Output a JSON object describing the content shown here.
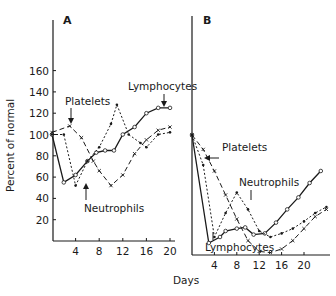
{
  "chart_data": [
    {
      "panel": "A",
      "type": "line",
      "title": "A",
      "xlabel": "Days",
      "ylabel": "Percent of normal",
      "xlim": [
        0,
        21
      ],
      "ylim": [
        0,
        175
      ],
      "xticks": [
        4,
        8,
        12,
        16,
        20
      ],
      "yticks": [
        20,
        40,
        60,
        80,
        100,
        120,
        140,
        160
      ],
      "grid": false,
      "legend": "inline annotations",
      "series": [
        {
          "name": "Lymphocytes",
          "style": "solid",
          "marker": "open-circle",
          "x": [
            0,
            2,
            4,
            6,
            7.5,
            9,
            10.5,
            12,
            14,
            16,
            18,
            20
          ],
          "y": [
            100,
            55,
            62,
            75,
            83,
            85,
            85,
            100,
            107,
            120,
            125,
            125
          ]
        },
        {
          "name": "Platelets",
          "style": "dashed",
          "marker": "x",
          "x": [
            0,
            3,
            5,
            7,
            8,
            10,
            12,
            14,
            16,
            18,
            20
          ],
          "y": [
            102,
            108,
            97,
            75,
            66,
            52,
            62,
            82,
            95,
            104,
            107
          ]
        },
        {
          "name": "Neutrophils",
          "style": "dotted",
          "marker": "dot",
          "x": [
            0,
            2,
            4,
            6,
            8,
            10,
            11,
            13,
            15,
            16,
            18,
            20
          ],
          "y": [
            100,
            100,
            52,
            75,
            88,
            110,
            128,
            100,
            92,
            88,
            100,
            102
          ]
        }
      ],
      "annotations": [
        "Platelets",
        "Lymphocytes",
        "Neutrophils"
      ]
    },
    {
      "panel": "B",
      "type": "line",
      "title": "B",
      "xlabel": "Days",
      "ylabel": "Percent of normal",
      "xlim": [
        0,
        24
      ],
      "ylim": [
        0,
        110
      ],
      "xticks": [
        4,
        8,
        12,
        16,
        20
      ],
      "grid": false,
      "legend": "inline annotations",
      "series": [
        {
          "name": "Lymphocytes",
          "style": "solid",
          "marker": "open-circle",
          "x": [
            0,
            3,
            5,
            6,
            8,
            9.5,
            11,
            13,
            15,
            17,
            19,
            21,
            23
          ],
          "y": [
            100,
            10,
            15,
            20,
            22,
            23,
            17,
            18,
            27,
            38,
            48,
            60,
            70
          ]
        },
        {
          "name": "Platelets",
          "style": "dashed",
          "marker": "x",
          "x": [
            0,
            2,
            4,
            6,
            8,
            10,
            12,
            14,
            16,
            18,
            20,
            22,
            24
          ],
          "y": [
            100,
            88,
            70,
            50,
            30,
            12,
            3,
            2,
            5,
            12,
            22,
            32,
            38
          ]
        },
        {
          "name": "Neutrophils",
          "style": "dotted",
          "marker": "dot",
          "x": [
            0,
            2,
            4,
            6,
            8,
            10,
            12,
            14,
            16,
            18,
            20,
            22,
            24
          ],
          "y": [
            100,
            75,
            15,
            35,
            52,
            38,
            20,
            15,
            18,
            22,
            28,
            35,
            40
          ]
        }
      ],
      "annotations": [
        "Platelets",
        "Neutrophils",
        "Lymphocytes"
      ]
    }
  ],
  "labels": {
    "panel_a": "A",
    "panel_b": "B",
    "ylabel": "Percent of normal",
    "xlabel": "Days",
    "a_platelets": "Platelets",
    "a_lymphocytes": "Lymphocytes",
    "a_neutrophils": "Neutrophils",
    "b_platelets": "Platelets",
    "b_neutrophils": "Neutrophils",
    "b_lymphocytes": "Lymphocytes"
  },
  "ticks": {
    "y": [
      "160",
      "140",
      "120",
      "100",
      "80",
      "60",
      "40",
      "20"
    ],
    "xa": [
      "4",
      "8",
      "12",
      "16",
      "20"
    ],
    "xb": [
      "4",
      "8",
      "12",
      "16",
      "20"
    ]
  }
}
